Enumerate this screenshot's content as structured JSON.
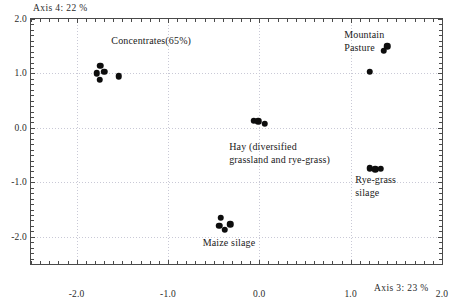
{
  "chart_data": {
    "type": "scatter",
    "title": "",
    "xlabel": "Axis 3: 23 %",
    "ylabel": "Axis 4: 22 %",
    "xlim": [
      -2.5,
      2.0
    ],
    "ylim": [
      -2.5,
      2.0
    ],
    "xticks": [
      "-2.0",
      "-1.0",
      "0.0",
      "1.0",
      "2.0"
    ],
    "xtick_values": [
      -2.0,
      -1.0,
      0.0,
      1.0,
      2.0
    ],
    "yticks": [
      "2.0",
      "1.0",
      "0.0",
      "-1.0",
      "-2.0"
    ],
    "ytick_values": [
      2.0,
      1.0,
      0.0,
      -1.0,
      -2.0
    ],
    "grid": true,
    "legend": "none (in-plot text annotations)",
    "marker": "filled-circle",
    "marker_color": "#0d0d0d",
    "series": [
      {
        "name": "Concentrates(65%)",
        "label_x": -1.62,
        "label_y": 1.6,
        "points": [
          {
            "x": -1.74,
            "y": 1.14
          },
          {
            "x": -1.7,
            "y": 1.03
          },
          {
            "x": -1.78,
            "y": 1.0
          },
          {
            "x": -1.75,
            "y": 0.88
          },
          {
            "x": -1.54,
            "y": 0.95
          }
        ]
      },
      {
        "name": "Mountain\nPasture",
        "label_x": 0.93,
        "label_y": 1.7,
        "points": [
          {
            "x": 1.4,
            "y": 1.5
          },
          {
            "x": 1.36,
            "y": 1.42
          },
          {
            "x": 1.21,
            "y": 1.03
          }
        ]
      },
      {
        "name": "Hay (diversified\ngrassland and rye-grass)",
        "label_x": -0.33,
        "label_y": -0.36,
        "points": [
          {
            "x": -0.06,
            "y": 0.13
          },
          {
            "x": -0.01,
            "y": 0.12
          },
          {
            "x": 0.06,
            "y": 0.08
          }
        ]
      },
      {
        "name": "Rye-grass\nsilage",
        "label_x": 1.05,
        "label_y": -0.96,
        "points": [
          {
            "x": 1.21,
            "y": -0.74
          },
          {
            "x": 1.27,
            "y": -0.76
          },
          {
            "x": 1.33,
            "y": -0.75
          }
        ]
      },
      {
        "name": "Maize silage",
        "label_x": -0.62,
        "label_y": -2.12,
        "points": [
          {
            "x": -0.42,
            "y": -1.65
          },
          {
            "x": -0.44,
            "y": -1.8
          },
          {
            "x": -0.38,
            "y": -1.87
          },
          {
            "x": -0.32,
            "y": -1.77
          }
        ]
      }
    ]
  },
  "axes": {
    "top_caption": "Axis 4: 22 %",
    "bottom_caption": "Axis 3: 23 %"
  }
}
